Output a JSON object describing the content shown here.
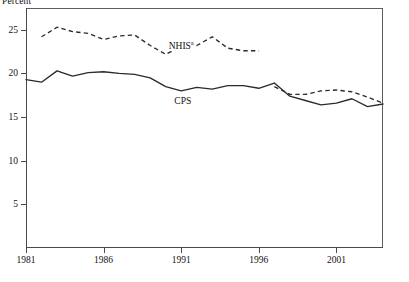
{
  "chart_data": {
    "type": "line",
    "title": "",
    "subtitle": "",
    "ylabel": "Percent",
    "xlabel": "",
    "xlim": [
      1981,
      2004
    ],
    "ylim": [
      0,
      27.5
    ],
    "grid": false,
    "legend_position": "inline-annotation",
    "yticks": [
      5,
      10,
      15,
      20,
      25
    ],
    "ytick_labels": [
      "5",
      "10",
      "15",
      "20",
      "25"
    ],
    "xticks": [
      1981,
      1986,
      1991,
      1996,
      2001
    ],
    "xtick_labels": [
      "1981",
      "1986",
      "1991",
      "1996",
      "2001"
    ],
    "annotations": [
      {
        "text": "NHIS",
        "superscript": "a",
        "x": 1991.0,
        "y": 23.3
      },
      {
        "text": "CPS",
        "superscript": "",
        "x": 1991.1,
        "y": 16.8
      }
    ],
    "series": [
      {
        "name": "CPS",
        "style": "solid",
        "x": [
          1981,
          1982,
          1983,
          1984,
          1985,
          1986,
          1987,
          1988,
          1989,
          1990,
          1991,
          1992,
          1993,
          1994,
          1995,
          1996,
          1997,
          1998,
          1999,
          2000,
          2001,
          2002,
          2003,
          2004
        ],
        "values": [
          19.3,
          19.0,
          20.3,
          19.7,
          20.1,
          20.2,
          20.0,
          19.9,
          19.5,
          18.5,
          18.0,
          18.4,
          18.2,
          18.6,
          18.6,
          18.3,
          18.9,
          17.4,
          16.9,
          16.4,
          16.6,
          17.1,
          16.2,
          16.5
        ]
      },
      {
        "name": "NHIS",
        "style": "dashed",
        "note_marker": "a",
        "has_break": true,
        "break_between": [
          1996,
          1997
        ],
        "x": [
          1982,
          1983,
          1984,
          1985,
          1986,
          1987,
          1988,
          1989,
          1990,
          1991,
          1992,
          1993,
          1994,
          1995,
          1996,
          1997,
          1998,
          1999,
          2000,
          2001,
          2002,
          2003,
          2004
        ],
        "values": [
          24.2,
          25.3,
          24.8,
          24.6,
          23.9,
          24.3,
          24.4,
          23.2,
          22.2,
          23.1,
          23.2,
          24.2,
          22.9,
          22.6,
          22.6,
          18.5,
          17.6,
          17.6,
          18.0,
          18.1,
          17.9,
          17.3,
          16.6
        ]
      }
    ]
  }
}
